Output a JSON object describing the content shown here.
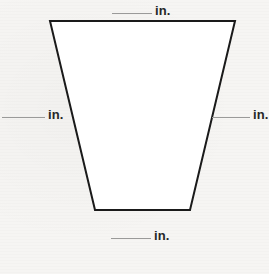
{
  "figure": {
    "name": "trapezoid",
    "stroke_color": "#1a1a1a",
    "fill_color": "#ffffff",
    "stroke_width": 2,
    "vertices": [
      {
        "label": "top-left",
        "x": 50,
        "y": 21
      },
      {
        "label": "top-right",
        "x": 235,
        "y": 21
      },
      {
        "label": "bottom-right",
        "x": 190,
        "y": 210
      },
      {
        "label": "bottom-left",
        "x": 95,
        "y": 210
      }
    ]
  },
  "canvas": {
    "width": 269,
    "height": 274,
    "background_color": "#f6f5f3"
  },
  "labels": {
    "top": {
      "blank": "",
      "unit": "in."
    },
    "left": {
      "blank": "",
      "unit": "in."
    },
    "right": {
      "blank": "",
      "unit": "in."
    },
    "bottom": {
      "blank": "",
      "unit": "in."
    }
  }
}
